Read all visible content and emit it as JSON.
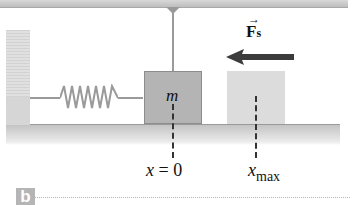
{
  "figure": {
    "panel_label": "b",
    "mass_label": "m",
    "equilibrium_label": "x = 0",
    "equilibrium_var": "x",
    "equilibrium_eq": "=",
    "equilibrium_val": "0",
    "max_label_var": "x",
    "max_label_sub": "max",
    "force_label": "F",
    "force_sub": "s",
    "force_vector_mark": "→",
    "force_direction": "left",
    "colors": {
      "mass": "#b4b4b4",
      "mass_ghost": "#dcdcdc",
      "arrow": "#3c3c3c",
      "spring": "#9a9a9a",
      "panel_tag": "#b5b5b5"
    }
  }
}
